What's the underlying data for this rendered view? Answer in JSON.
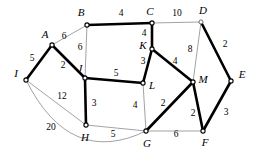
{
  "diagram": {
    "type": "graph",
    "width": 257,
    "height": 159,
    "background_color": "#ffffff",
    "colors": {
      "bold_edge": "#000000",
      "thin_edge": "#8a8a8a",
      "node_fill": "#ffffff",
      "node_stroke": "#4a4a4a",
      "label_text": "#000000"
    },
    "legend_note": "Bold edges form a highlighted subgraph (spanning tree); thin gray edges are remaining graph edges."
  },
  "vertices": [
    {
      "id": "A",
      "label": "A",
      "x": 52,
      "y": 45,
      "label_x": 45,
      "label_y": 35,
      "bold": true
    },
    {
      "id": "B",
      "label": "B",
      "x": 87,
      "y": 25,
      "label_x": 81,
      "label_y": 13,
      "bold": true
    },
    {
      "id": "C",
      "label": "C",
      "x": 152,
      "y": 23,
      "label_x": 150,
      "label_y": 12,
      "bold": true
    },
    {
      "id": "D",
      "label": "D",
      "x": 201,
      "y": 22,
      "label_x": 203,
      "label_y": 11,
      "bold": false
    },
    {
      "id": "E",
      "label": "E",
      "x": 231,
      "y": 81,
      "label_x": 242,
      "label_y": 75,
      "bold": true
    },
    {
      "id": "F",
      "label": "F",
      "x": 203,
      "y": 131,
      "label_x": 205,
      "label_y": 143,
      "bold": true
    },
    {
      "id": "G",
      "label": "G",
      "x": 146,
      "y": 131,
      "label_x": 147,
      "label_y": 144,
      "bold": true
    },
    {
      "id": "H",
      "label": "H",
      "x": 86,
      "y": 125,
      "label_x": 85,
      "label_y": 138,
      "bold": true
    },
    {
      "id": "I",
      "label": "I",
      "x": 26,
      "y": 80,
      "label_x": 16,
      "label_y": 74,
      "bold": true
    },
    {
      "id": "J",
      "label": "J",
      "x": 85,
      "y": 78,
      "label_x": 80,
      "label_y": 69,
      "bold": true
    },
    {
      "id": "K",
      "label": "K",
      "x": 152,
      "y": 49,
      "label_x": 143,
      "label_y": 46,
      "bold": true
    },
    {
      "id": "L",
      "label": "L",
      "x": 143,
      "y": 83,
      "label_x": 152,
      "label_y": 86,
      "bold": true
    },
    {
      "id": "M",
      "label": "M",
      "x": 193,
      "y": 82,
      "label_x": 203,
      "label_y": 80,
      "bold": true
    }
  ],
  "edges": [
    {
      "id": "A-B",
      "from": "A",
      "to": "B",
      "weight": "6",
      "bold": false,
      "curved": false,
      "label_x": 64,
      "label_y": 37
    },
    {
      "id": "B-C",
      "from": "B",
      "to": "C",
      "weight": "4",
      "bold": true,
      "curved": false,
      "label_x": 121,
      "label_y": 14
    },
    {
      "id": "C-D",
      "from": "C",
      "to": "D",
      "weight": "10",
      "bold": false,
      "curved": false,
      "label_x": 177,
      "label_y": 14
    },
    {
      "id": "B-J",
      "from": "B",
      "to": "J",
      "weight": "6",
      "bold": false,
      "curved": false,
      "label_x": 80,
      "label_y": 48
    },
    {
      "id": "C-K",
      "from": "C",
      "to": "K",
      "weight": "4",
      "bold": true,
      "curved": false,
      "label_x": 144,
      "label_y": 34
    },
    {
      "id": "D-M",
      "from": "D",
      "to": "M",
      "weight": "8",
      "bold": false,
      "curved": false,
      "label_x": 190,
      "label_y": 50
    },
    {
      "id": "D-E",
      "from": "D",
      "to": "E",
      "weight": "2",
      "bold": true,
      "curved": false,
      "label_x": 225,
      "label_y": 45
    },
    {
      "id": "I-A",
      "from": "I",
      "to": "A",
      "weight": "5",
      "bold": true,
      "curved": false,
      "label_x": 32,
      "label_y": 59
    },
    {
      "id": "A-J",
      "from": "A",
      "to": "J",
      "weight": "2",
      "bold": true,
      "curved": false,
      "label_x": 63,
      "label_y": 66
    },
    {
      "id": "J-L",
      "from": "J",
      "to": "L",
      "weight": "5",
      "bold": true,
      "curved": false,
      "label_x": 116,
      "label_y": 74
    },
    {
      "id": "K-L",
      "from": "K",
      "to": "L",
      "weight": "3",
      "bold": true,
      "curved": false,
      "label_x": 143,
      "label_y": 62
    },
    {
      "id": "K-M",
      "from": "K",
      "to": "M",
      "weight": "4",
      "bold": true,
      "curved": false,
      "label_x": 175,
      "label_y": 62
    },
    {
      "id": "I-H",
      "from": "I",
      "to": "H",
      "weight": "12",
      "bold": false,
      "curved": false,
      "label_x": 62,
      "label_y": 97
    },
    {
      "id": "J-H",
      "from": "J",
      "to": "H",
      "weight": "3",
      "bold": true,
      "curved": false,
      "label_x": 94,
      "label_y": 104
    },
    {
      "id": "L-G",
      "from": "L",
      "to": "G",
      "weight": "4",
      "bold": false,
      "curved": false,
      "label_x": 135,
      "label_y": 106
    },
    {
      "id": "G-M",
      "from": "G",
      "to": "M",
      "weight": "2",
      "bold": true,
      "curved": false,
      "label_x": 163,
      "label_y": 104
    },
    {
      "id": "M-F",
      "from": "M",
      "to": "F",
      "weight": "2",
      "bold": true,
      "curved": false,
      "label_x": 193,
      "label_y": 114
    },
    {
      "id": "E-F",
      "from": "E",
      "to": "F",
      "weight": "3",
      "bold": true,
      "curved": false,
      "label_x": 226,
      "label_y": 113
    },
    {
      "id": "H-G",
      "from": "H",
      "to": "G",
      "weight": "5",
      "bold": false,
      "curved": false,
      "label_x": 113,
      "label_y": 135
    },
    {
      "id": "G-F",
      "from": "G",
      "to": "F",
      "weight": "6",
      "bold": false,
      "curved": false,
      "label_x": 176,
      "label_y": 135
    },
    {
      "id": "I-G",
      "from": "I",
      "to": "G",
      "weight": "20",
      "bold": false,
      "curved": true,
      "curve_cx": 70,
      "curve_cy": 168,
      "label_x": 51,
      "label_y": 128
    }
  ]
}
